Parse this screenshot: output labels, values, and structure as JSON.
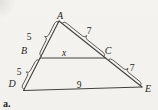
{
  "figure": {
    "type": "geometry-diagram",
    "caption": "a.",
    "points": [
      {
        "id": "A",
        "label": "A"
      },
      {
        "id": "B",
        "label": "B"
      },
      {
        "id": "C",
        "label": "C"
      },
      {
        "id": "D",
        "label": "D"
      },
      {
        "id": "E",
        "label": "E"
      }
    ],
    "segments": [
      {
        "id": "AB",
        "value": "5"
      },
      {
        "id": "BD",
        "value": "5"
      },
      {
        "id": "AC",
        "value": "7"
      },
      {
        "id": "CE",
        "value": "7"
      },
      {
        "id": "BC",
        "value": "x"
      },
      {
        "id": "DE",
        "value": "9"
      }
    ]
  },
  "colors": {
    "background": "#f3f2ee",
    "line": "#424242",
    "text": "#262626"
  }
}
